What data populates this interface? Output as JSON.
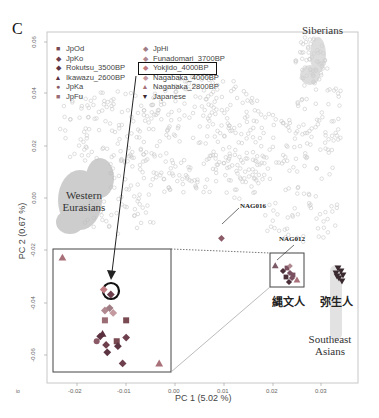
{
  "figure": {
    "panel_label": "C",
    "corner_mark": "io"
  },
  "chart_data": {
    "type": "scatter",
    "title": "",
    "xlabel": "PC 1 (5.02 %)",
    "ylabel": "PC 2 (0.67 %)",
    "xlim": [
      -0.026,
      0.038
    ],
    "ylim": [
      -0.067,
      0.064
    ],
    "x_ticks": [
      "-0.02",
      "-0.01",
      "0.00",
      "0.01",
      "0.02",
      "0.03"
    ],
    "y_ticks": [
      "0.06",
      "0.04",
      "0.02",
      "0.00",
      "-0.02",
      "-0.04",
      "-0.06"
    ],
    "grid": false,
    "legend_position": "top-left inside",
    "legend": [
      {
        "label": "JpOd",
        "marker": "square",
        "color": "#7a4a52"
      },
      {
        "label": "JpKo",
        "marker": "diamond",
        "color": "#6e3f4c"
      },
      {
        "label": "Rokutsu_3500BP",
        "marker": "diamond",
        "color": "#5c3442"
      },
      {
        "label": "Ikawazu_2600BP",
        "marker": "triangle-up",
        "color": "#5a2f3e"
      },
      {
        "label": "JpKa",
        "marker": "circle",
        "color": "#8a5a66"
      },
      {
        "label": "JpFu",
        "marker": "square",
        "color": "#9a6c74"
      },
      {
        "label": "JpHi",
        "marker": "diamond",
        "color": "#a07c84"
      },
      {
        "label": "Funadomari_3700BP",
        "marker": "diamond",
        "color": "#b08890"
      },
      {
        "label": "Yokjido_4000BP",
        "marker": "diamond",
        "color": "#c07a80",
        "highlighted": true
      },
      {
        "label": "Nagabaka_4000BP",
        "marker": "diamond",
        "color": "#c49aa0"
      },
      {
        "label": "Nagabaka_2800BP",
        "marker": "triangle-up",
        "color": "#a87078"
      },
      {
        "label": "Japanese",
        "marker": "triangle-down",
        "color": "#3a2a30"
      }
    ],
    "region_labels": [
      {
        "text": "Siberians",
        "x": 0.031,
        "y": 0.058
      },
      {
        "text": "Western Eurasians",
        "x": -0.021,
        "y": 0.0
      },
      {
        "text": "Southeast Asians",
        "x": 0.031,
        "y": -0.064
      }
    ],
    "group_labels": [
      {
        "text": "縄文人",
        "meaning": "Jomon people",
        "x": 0.0235,
        "y": -0.041
      },
      {
        "text": "弥生人",
        "meaning": "Yayoi people",
        "x": 0.033,
        "y": -0.041
      }
    ],
    "annotations": [
      {
        "text": "NAG016",
        "x": 0.009,
        "y": -0.0155
      },
      {
        "text": "NAG012",
        "x": 0.0205,
        "y": -0.0255
      }
    ],
    "points": [
      {
        "group": "Nagabaka_2800BP",
        "x": 0.0205,
        "y": -0.026
      },
      {
        "group": "Nagabaka_4000BP",
        "x": 0.0095,
        "y": -0.0155
      },
      {
        "group": "Yokjido_4000BP",
        "x": 0.0235,
        "y": -0.029
      },
      {
        "group": "JpKo",
        "x": 0.023,
        "y": -0.032
      },
      {
        "group": "Japanese",
        "x": 0.034,
        "y": -0.031
      }
    ],
    "background_series": "gray open circles (reference populations)",
    "inset": {
      "description": "zoomed view of Jomon cluster",
      "points": [
        {
          "group": "Nagabaka_2800BP",
          "marker": "triangle-up",
          "ix": 0.08,
          "iy": 0.07
        },
        {
          "group": "Yokjido_4000BP",
          "marker": "diamond",
          "ix": 0.43,
          "iy": 0.33,
          "circled": true
        },
        {
          "group": "JpKo",
          "marker": "diamond",
          "ix": 0.49,
          "iy": 0.37
        },
        {
          "group": "Funadomari_3700BP",
          "marker": "diamond",
          "ix": 0.44,
          "iy": 0.5
        },
        {
          "group": "Nagabaka_4000BP",
          "marker": "diamond",
          "ix": 0.51,
          "iy": 0.52
        },
        {
          "group": "JpHi",
          "marker": "diamond",
          "ix": 0.48,
          "iy": 0.48
        },
        {
          "group": "JpFu",
          "marker": "square",
          "ix": 0.44,
          "iy": 0.58
        },
        {
          "group": "JpOd",
          "marker": "square",
          "ix": 0.62,
          "iy": 0.58
        },
        {
          "group": "Rokutsu_3500BP",
          "marker": "diamond",
          "ix": 0.4,
          "iy": 0.71
        },
        {
          "group": "Ikawazu_2600BP",
          "marker": "triangle-up",
          "ix": 0.42,
          "iy": 0.69
        },
        {
          "group": "JpKa",
          "marker": "circle",
          "ix": 0.37,
          "iy": 0.75
        },
        {
          "group": "JpKo",
          "marker": "diamond",
          "ix": 0.45,
          "iy": 0.78
        },
        {
          "group": "JpOd",
          "marker": "square",
          "ix": 0.54,
          "iy": 0.75
        },
        {
          "group": "Rokutsu_3500BP",
          "marker": "diamond",
          "ix": 0.55,
          "iy": 0.79
        },
        {
          "group": "JpKo",
          "marker": "diamond",
          "ix": 0.62,
          "iy": 0.72
        },
        {
          "group": "Rokutsu_3500BP",
          "marker": "diamond",
          "ix": 0.46,
          "iy": 0.84
        },
        {
          "group": "JpKo",
          "marker": "diamond",
          "ix": 0.59,
          "iy": 0.93
        },
        {
          "group": "Nagabaka_2800BP",
          "marker": "triangle-up",
          "ix": 0.9,
          "iy": 0.93
        }
      ]
    }
  },
  "colors": {
    "frame": "#bfbfbf",
    "inset_frame": "#444444",
    "background_points": "#c8c8c8",
    "highlight_box": "#111111"
  }
}
